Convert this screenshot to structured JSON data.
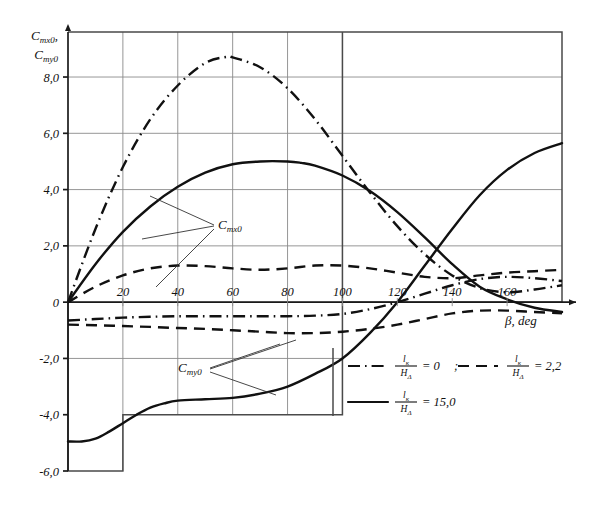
{
  "figure": {
    "y_axis_label_line1": "C",
    "y_axis_label_line1_sub": "mx0",
    "y_axis_label_line1_tail": ",",
    "y_axis_label_line2": "C",
    "y_axis_label_line2_sub": "my0",
    "x_axis_label": "β, deg"
  },
  "annotations": [
    {
      "name": "cmx0",
      "base": "C",
      "sub": "mx0",
      "x": 218,
      "y": 229
    },
    {
      "name": "cmy0",
      "base": "C",
      "sub": "my0",
      "x": 178,
      "y": 372
    }
  ],
  "legend": {
    "items": [
      {
        "style": "dash-dot",
        "numerator": "l",
        "numerator_sub": "к",
        "denominator": "H",
        "denominator_sub": "Δ",
        "equals": "= 0",
        "separator": ";"
      },
      {
        "style": "dashed",
        "numerator": "l",
        "numerator_sub": "к",
        "denominator": "H",
        "denominator_sub": "Δ",
        "equals": "= 2,2",
        "separator": ""
      },
      {
        "style": "solid",
        "numerator": "l",
        "numerator_sub": "к",
        "denominator": "H",
        "denominator_sub": "Δ",
        "equals": "= 15,0",
        "separator": ""
      }
    ]
  },
  "chart_data": {
    "type": "line",
    "title": "",
    "subtitle": "",
    "xlabel": "β, deg",
    "ylabel": "C_mx0, C_my0",
    "xlim": [
      0,
      180
    ],
    "ylim": [
      -6.0,
      9.6
    ],
    "grid": true,
    "legend_position": "bottom-right",
    "xticks": [
      20,
      40,
      60,
      80,
      100,
      120,
      140,
      160
    ],
    "xticklabels": [
      "20",
      "40",
      "60",
      "80",
      "100",
      "120",
      "140",
      "160"
    ],
    "yticks": [
      8.0,
      6.0,
      4.0,
      2.0,
      0,
      -2.0,
      -4.0,
      -6.0
    ],
    "yticklabels": [
      "8,0",
      "6,0",
      "4,0",
      "2,0",
      "0",
      "-2,0",
      "-4,0",
      "-6,0"
    ],
    "series": [
      {
        "name": "C_mx0, l_k/H_D = 0",
        "quantity": "C_mx0",
        "ratio": "0",
        "style": "dash-dot",
        "x": [
          0,
          10,
          20,
          30,
          40,
          50,
          58,
          60,
          70,
          80,
          90,
          100,
          110,
          120,
          130,
          140,
          150,
          160,
          170,
          180
        ],
        "y": [
          0.0,
          2.6,
          4.8,
          6.5,
          7.7,
          8.5,
          8.72,
          8.7,
          8.35,
          7.6,
          6.5,
          5.2,
          3.9,
          2.7,
          1.7,
          0.95,
          0.5,
          0.35,
          0.45,
          0.6
        ]
      },
      {
        "name": "C_mx0, l_k/H_D = 2,2",
        "quantity": "C_mx0",
        "ratio": "2,2",
        "style": "dashed",
        "x": [
          0,
          10,
          20,
          30,
          40,
          50,
          60,
          70,
          80,
          90,
          100,
          110,
          120,
          130,
          140,
          150,
          160,
          170,
          180
        ],
        "y": [
          0.0,
          0.55,
          0.95,
          1.2,
          1.3,
          1.28,
          1.2,
          1.15,
          1.2,
          1.3,
          1.3,
          1.2,
          1.05,
          0.9,
          0.85,
          0.95,
          1.05,
          1.1,
          1.15
        ]
      },
      {
        "name": "C_mx0, l_k/H_D = 15,0",
        "quantity": "C_mx0",
        "ratio": "15,0",
        "style": "solid",
        "x": [
          0,
          10,
          20,
          30,
          40,
          50,
          60,
          70,
          80,
          85,
          90,
          100,
          110,
          120,
          130,
          140,
          150,
          160,
          170,
          180
        ],
        "y": [
          0.0,
          1.35,
          2.5,
          3.4,
          4.1,
          4.6,
          4.9,
          5.0,
          5.0,
          4.95,
          4.85,
          4.5,
          3.95,
          3.2,
          2.3,
          1.35,
          0.55,
          0.1,
          -0.2,
          -0.35
        ]
      },
      {
        "name": "C_my0, l_k/H_D = 0",
        "quantity": "C_my0",
        "ratio": "0",
        "style": "dash-dot",
        "x": [
          0,
          10,
          20,
          30,
          40,
          50,
          60,
          70,
          80,
          90,
          100,
          110,
          120,
          130,
          140,
          150,
          160,
          170,
          180
        ],
        "y": [
          -0.65,
          -0.6,
          -0.55,
          -0.52,
          -0.5,
          -0.5,
          -0.5,
          -0.5,
          -0.5,
          -0.48,
          -0.42,
          -0.25,
          0.0,
          0.3,
          0.6,
          0.82,
          0.9,
          0.85,
          0.75
        ]
      },
      {
        "name": "C_my0, l_k/H_D = 2,2",
        "quantity": "C_my0",
        "ratio": "2,2",
        "style": "dashed",
        "x": [
          0,
          10,
          20,
          30,
          40,
          50,
          60,
          70,
          80,
          90,
          100,
          110,
          120,
          130,
          140,
          150,
          160,
          170,
          180
        ],
        "y": [
          -0.8,
          -0.82,
          -0.85,
          -0.88,
          -0.92,
          -0.95,
          -1.0,
          -1.05,
          -1.1,
          -1.1,
          -1.05,
          -0.95,
          -0.8,
          -0.6,
          -0.4,
          -0.3,
          -0.3,
          -0.35,
          -0.4
        ]
      },
      {
        "name": "C_my0, l_k/H_D = 15,0",
        "quantity": "C_my0",
        "ratio": "15,0",
        "style": "solid",
        "x": [
          0,
          5,
          10,
          15,
          20,
          25,
          30,
          35,
          40,
          50,
          60,
          70,
          80,
          90,
          100,
          110,
          120,
          130,
          140,
          150,
          160,
          170,
          180
        ],
        "y": [
          -4.95,
          -4.95,
          -4.85,
          -4.6,
          -4.3,
          -4.0,
          -3.75,
          -3.6,
          -3.5,
          -3.45,
          -3.4,
          -3.25,
          -3.0,
          -2.55,
          -2.0,
          -1.1,
          0.0,
          1.3,
          2.6,
          3.8,
          4.7,
          5.3,
          5.65
        ]
      }
    ]
  }
}
